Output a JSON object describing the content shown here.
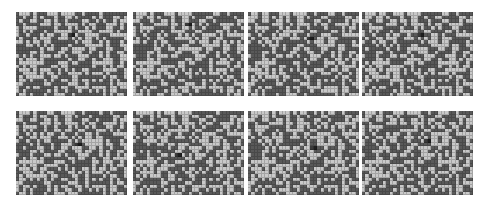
{
  "figure": {
    "grid": {
      "cols": 32,
      "rows": 24
    },
    "colors": {
      "dark": "#595959",
      "light": "#c9c9c9",
      "marker": "#1e1e1e",
      "marker_light": "#3a3a3a"
    },
    "panels": [
      {
        "id": 1,
        "x": 16,
        "y": 12,
        "seed": 11,
        "marker": {
          "col": 16,
          "row": 6
        }
      },
      {
        "id": 2,
        "x": 133,
        "y": 12,
        "seed": 23,
        "marker": {
          "col": 16,
          "row": 3
        }
      },
      {
        "id": 3,
        "x": 248,
        "y": 12,
        "seed": 37,
        "marker": {
          "col": 18,
          "row": 7
        }
      },
      {
        "id": 4,
        "x": 362,
        "y": 12,
        "seed": 41,
        "marker": {
          "col": 17,
          "row": 6
        }
      },
      {
        "id": 5,
        "x": 16,
        "y": 111,
        "seed": 53,
        "marker": {
          "col": 18,
          "row": 9
        }
      },
      {
        "id": 6,
        "x": 133,
        "y": 111,
        "seed": 67,
        "marker": {
          "col": 13,
          "row": 12
        }
      },
      {
        "id": 7,
        "x": 248,
        "y": 111,
        "seed": 79,
        "marker": {
          "col": 19,
          "row": 10
        }
      },
      {
        "id": 8,
        "x": 362,
        "y": 111,
        "seed": 83,
        "marker": {
          "col": 19,
          "row": 8
        }
      }
    ]
  }
}
